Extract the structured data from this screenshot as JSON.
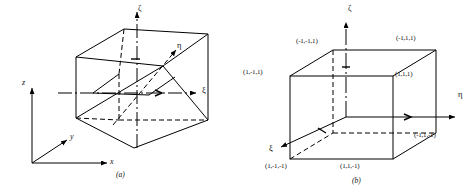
{
  "figure": {
    "panels": [
      {
        "id": "a",
        "caption": "(a)",
        "description": "distorted-wedge-element",
        "global_axes": [
          {
            "name": "z-axis",
            "label": "z"
          },
          {
            "name": "y-axis",
            "label": "y"
          },
          {
            "name": "x-axis",
            "label": "x"
          }
        ],
        "local_axes": [
          {
            "name": "zeta-axis",
            "label": "ζ"
          },
          {
            "name": "eta-axis",
            "label": "η"
          },
          {
            "name": "xi-axis",
            "label": "ξ"
          }
        ]
      },
      {
        "id": "b",
        "caption": "(b)",
        "description": "parent-cube-natural-coordinates",
        "local_axes": [
          {
            "name": "zeta-axis",
            "label": "ζ"
          },
          {
            "name": "eta-axis",
            "label": "η"
          },
          {
            "name": "xi-axis",
            "label": "ξ"
          }
        ],
        "vertices": [
          {
            "name": "vertex-back-top-left",
            "label": "(-1,-1,1)"
          },
          {
            "name": "vertex-back-top-right",
            "label": "(-1,1,1)"
          },
          {
            "name": "vertex-front-top-left",
            "label": "(1,-1,1)"
          },
          {
            "name": "vertex-front-top-right",
            "label": "(1,1,1)"
          },
          {
            "name": "vertex-back-bottom-right",
            "label": "(-1,1,-1)"
          },
          {
            "name": "vertex-front-bottom-left",
            "label": "(1,-1,-1)"
          },
          {
            "name": "vertex-front-bottom-right",
            "label": "(1,1,-1)"
          }
        ]
      }
    ],
    "colors": {
      "ink": "#000000",
      "background": "#ffffff"
    }
  }
}
